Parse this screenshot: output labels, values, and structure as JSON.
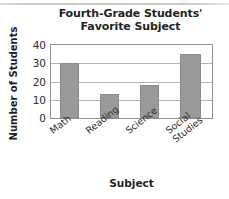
{
  "chart_data": {
    "type": "bar",
    "title": "Fourth-Grade Students' Favorite Subject",
    "title_line1": "Fourth-Grade Students'",
    "title_line2": "Favorite Subject",
    "categories": [
      "Math",
      "Reading",
      "Science",
      "Social Studies"
    ],
    "values": [
      30,
      13,
      18,
      35
    ],
    "xlabel": "Subject",
    "ylabel": "Number of Students",
    "ylim": [
      0,
      40
    ],
    "yticks": [
      40,
      30,
      20,
      10,
      0
    ],
    "grid": true,
    "legend": null,
    "bar_color": "#9a9a9a",
    "axis_color": "#8f8f8f",
    "grid_color": "#b4b4b4",
    "category_labels": [
      {
        "line1": "Math",
        "line2": ""
      },
      {
        "line1": "Reading",
        "line2": ""
      },
      {
        "line1": "Science",
        "line2": ""
      },
      {
        "line1": "Social",
        "line2": "Studies"
      }
    ]
  }
}
